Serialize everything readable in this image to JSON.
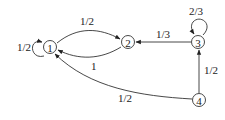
{
  "nodes": [
    {
      "id": "1",
      "label": "1",
      "x": 50,
      "y": 47
    },
    {
      "id": "2",
      "label": "2",
      "x": 128,
      "y": 42
    },
    {
      "id": "3",
      "label": "3",
      "x": 198,
      "y": 42
    },
    {
      "id": "4",
      "label": "4",
      "x": 199,
      "y": 100
    }
  ],
  "edges": [
    {
      "from": "1",
      "to": "1",
      "label": "1/2"
    },
    {
      "from": "1",
      "to": "2",
      "label": "1/2"
    },
    {
      "from": "2",
      "to": "1",
      "label": "1"
    },
    {
      "from": "3",
      "to": "2",
      "label": "1/3"
    },
    {
      "from": "3",
      "to": "3",
      "label": "2/3"
    },
    {
      "from": "4",
      "to": "3",
      "label": "1/2"
    },
    {
      "from": "4",
      "to": "1",
      "label": "1/2"
    }
  ]
}
